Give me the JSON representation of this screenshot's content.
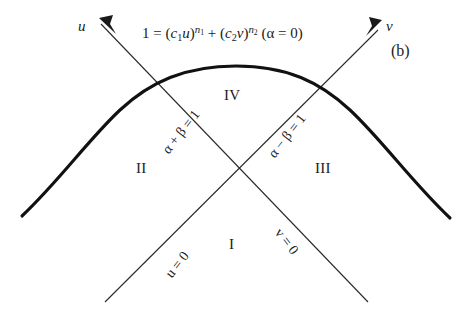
{
  "figure": {
    "caption": "(b)",
    "background_color": "#ffffff",
    "ink_color": "#1a1a1a"
  },
  "axes": [
    {
      "name": "u-axis",
      "label": "u",
      "direction": "up-left"
    },
    {
      "name": "v-axis",
      "label": "v",
      "direction": "up-right"
    }
  ],
  "equation": {
    "lhs": "1",
    "eq": "=",
    "term1_base_open": "(",
    "term1_c": "c",
    "term1_c_sub": "1",
    "term1_var": "u",
    "term1_base_close": ")",
    "term1_exp": "n",
    "term1_exp_sub": "1",
    "plus": "+",
    "term2_base_open": "(",
    "term2_c": "c",
    "term2_c_sub": "2",
    "term2_var": "v",
    "term2_base_close": ")",
    "term2_exp": "n",
    "term2_exp_sub": "2",
    "condition": "(α = 0)",
    "plain_text": "1 = (c1u)^n1 + (c2v)^n2 (α = 0)"
  },
  "boundary_lines": [
    {
      "name": "alpha-plus-beta",
      "label": "α + β = 1",
      "orientation": "up-right"
    },
    {
      "name": "alpha-minus-beta",
      "label": "α − β = 1",
      "orientation": "up-right"
    },
    {
      "name": "u-zero",
      "label": "u = 0",
      "orientation": "up-right"
    },
    {
      "name": "v-zero",
      "label": "v = 0",
      "orientation": "down-right"
    }
  ],
  "regions": [
    {
      "name": "region-one",
      "label": "I"
    },
    {
      "name": "region-two",
      "label": "II"
    },
    {
      "name": "region-three",
      "label": "III"
    },
    {
      "name": "region-four",
      "label": "IV"
    }
  ]
}
